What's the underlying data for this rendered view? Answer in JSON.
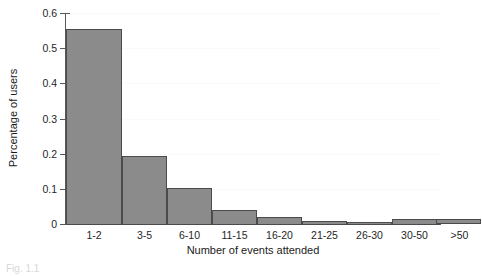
{
  "chart_data": {
    "type": "bar",
    "title": "",
    "xlabel": "Number of events attended",
    "ylabel": "Percentage of users",
    "categories": [
      "1-2",
      "3-5",
      "6-10",
      "11-15",
      "16-20",
      "21-25",
      "26-30",
      "30-50",
      ">50"
    ],
    "values": [
      0.558,
      0.195,
      0.105,
      0.043,
      0.023,
      0.012,
      0.008,
      0.018,
      0.015
    ],
    "ylim": [
      0,
      0.6
    ],
    "yticks": [
      0,
      0.1,
      0.2,
      0.3,
      0.4,
      0.5,
      0.6
    ],
    "ytick_labels": [
      "0",
      "0.1",
      "0.2",
      "0.3",
      "0.4",
      "0.5",
      "0.6"
    ],
    "grid": true,
    "legend": null,
    "bar_fill_color": "#8b8b8b",
    "bar_edge_color": "#4b4b4b",
    "axis_color": "#585858"
  },
  "axis": {
    "y_title": "Percentage of users",
    "x_title": "Number of events attended",
    "ytick_0": "0",
    "ytick_1": "0.1",
    "ytick_2": "0.2",
    "ytick_3": "0.3",
    "ytick_4": "0.4",
    "ytick_5": "0.5",
    "ytick_6": "0.6"
  },
  "caption": {
    "text": "Fig. 1.1"
  }
}
